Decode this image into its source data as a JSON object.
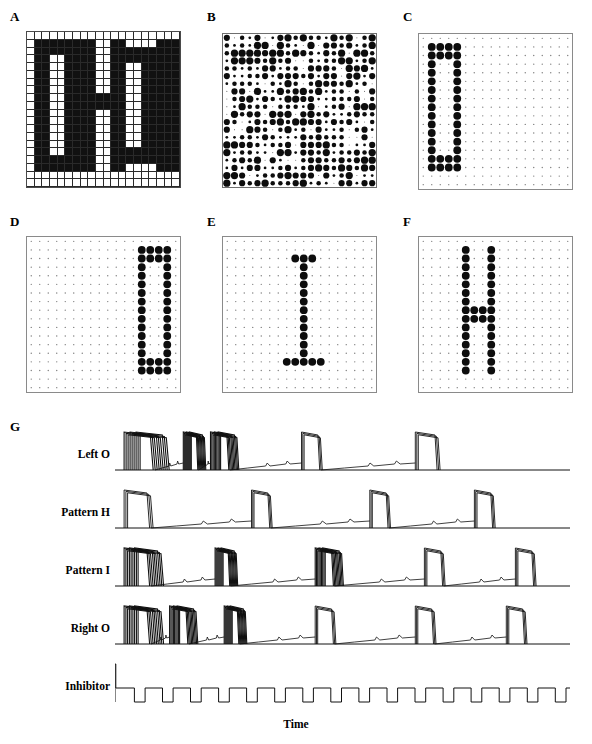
{
  "figure": {
    "panels": [
      {
        "id": "A",
        "label": "A",
        "type": "bitmap",
        "caption_text": "OHIO"
      },
      {
        "id": "B",
        "label": "B",
        "type": "hinton-random"
      },
      {
        "id": "C",
        "label": "C",
        "type": "hinton-pattern",
        "pattern": "Left O"
      },
      {
        "id": "D",
        "label": "D",
        "type": "hinton-pattern",
        "pattern": "Right O"
      },
      {
        "id": "E",
        "label": "E",
        "type": "hinton-pattern",
        "pattern": "I"
      },
      {
        "id": "F",
        "label": "F",
        "type": "hinton-pattern",
        "pattern": "H"
      },
      {
        "id": "G",
        "label": "G",
        "type": "time-series"
      }
    ],
    "axis": {
      "xlabel": "Time"
    },
    "colors": {
      "ink": "#111111",
      "grid_line": "#2a2a2a",
      "panel_border": "#8a8a8a",
      "background": "#ffffff"
    }
  },
  "chart_data": {
    "type": "line",
    "title": "",
    "xlabel": "Time",
    "ylabel": "",
    "grid": false,
    "legend": "none",
    "series": [
      {
        "name": "Left O",
        "label": "Left O"
      },
      {
        "name": "Pattern H",
        "label": "Pattern H"
      },
      {
        "name": "Pattern I",
        "label": "Pattern I"
      },
      {
        "name": "Right O",
        "label": "Right O"
      },
      {
        "name": "Inhibitor",
        "label": "Inhibitor"
      }
    ],
    "traces": {
      "Left O": {
        "burst_starts": [
          2,
          15,
          21,
          41,
          66
        ],
        "burst_widths": [
          8,
          4,
          5,
          5,
          6
        ],
        "thick": true
      },
      "Pattern H": {
        "burst_starts": [
          2,
          30,
          56,
          79
        ],
        "burst_widths": [
          7,
          5,
          5,
          5
        ],
        "thick": false
      },
      "Pattern I": {
        "burst_starts": [
          2,
          22,
          44,
          68,
          88
        ],
        "burst_widths": [
          7,
          4,
          5,
          5,
          5
        ],
        "thick": true
      },
      "Right O": {
        "burst_starts": [
          2,
          12,
          24,
          44,
          66,
          86
        ],
        "burst_widths": [
          7,
          5,
          4,
          5,
          5,
          5
        ],
        "thick": true
      },
      "Inhibitor": {
        "pulse_count": 16,
        "type": "square"
      }
    }
  },
  "panelA_bitmap": {
    "rows": 20,
    "cols": 20,
    "note": "block letters spelling OHIO",
    "cells": [
      "00000000000000000000",
      "01111000111001110111",
      "01001000101000100101",
      "01001000101000100101",
      "01001000101000100101",
      "01001000101000100101",
      "01001000111000100101",
      "01001000101000100101",
      "01001000101000100101",
      "01001000101000100101",
      "01001000101000100101",
      "01001000101000100101",
      "01001000101000100101",
      "01001000101000100101",
      "01111000101011100111",
      "00000000000000000000",
      "00000000000000000000",
      "00000000000000000000",
      "00000000000000000000",
      "00000000000000000000"
    ]
  },
  "panelC_pattern": {
    "rows": 18,
    "cols": 18,
    "name": "Left O",
    "cells": [
      "000000000000000000",
      "011110000000000000",
      "011110000000000000",
      "010010000000000000",
      "010010000000000000",
      "010010000000000000",
      "010010000000000000",
      "010010000000000000",
      "010010000000000000",
      "010010000000000000",
      "010010000000000000",
      "010010000000000000",
      "010010000000000000",
      "010010000000000000",
      "011110000000000000",
      "011110000000000000",
      "000000000000000000",
      "000000000000000000"
    ]
  },
  "panelD_pattern": {
    "rows": 18,
    "cols": 18,
    "name": "Right O",
    "cells": [
      "000000000000000000",
      "000000000000011110",
      "000000000000011110",
      "000000000000010010",
      "000000000000010010",
      "000000000000010010",
      "000000000000010010",
      "000000000000010010",
      "000000000000010010",
      "000000000000010010",
      "000000000000010010",
      "000000000000010010",
      "000000000000010010",
      "000000000000010010",
      "000000000000011110",
      "000000000000011110",
      "000000000000000000",
      "000000000000000000"
    ]
  },
  "panelE_pattern": {
    "rows": 18,
    "cols": 18,
    "name": "Pattern I",
    "cells": [
      "000000000000000000",
      "000000000000000000",
      "000000000111000000",
      "000000000010000000",
      "000000000010000000",
      "000000000010000000",
      "000000000010000000",
      "000000000010000000",
      "000000000010000000",
      "000000000010000000",
      "000000000010000000",
      "000000000010000000",
      "000000000010000000",
      "000000000010000000",
      "000000001111100000",
      "000000000000000000",
      "000000000000000000",
      "000000000000000000"
    ]
  },
  "panelF_pattern": {
    "rows": 18,
    "cols": 18,
    "name": "Pattern H",
    "cells": [
      "000000000000000000",
      "000001001000000000",
      "000001001000000000",
      "000001001000000000",
      "000001001000000000",
      "000001001000000000",
      "000001001000000000",
      "000001001000000000",
      "000001111000000000",
      "000001111000000000",
      "000001001000000000",
      "000001001000000000",
      "000001001000000000",
      "000001001000000000",
      "000001001000000000",
      "000001001000000000",
      "000000000000000000",
      "000000000000000000"
    ]
  },
  "panelB_random": {
    "rows": 20,
    "cols": 20,
    "seed": 20250101
  }
}
